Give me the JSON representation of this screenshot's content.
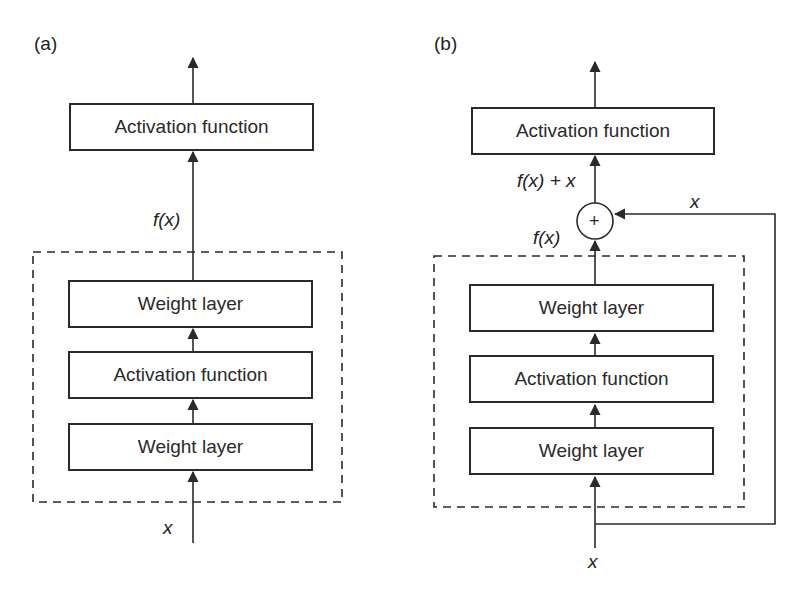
{
  "panels": {
    "a": {
      "label": "(a)",
      "top_box": "Activation function",
      "output_label": "f(x)",
      "block": [
        "Weight layer",
        "Activation function",
        "Weight layer"
      ],
      "input_label": "x"
    },
    "b": {
      "label": "(b)",
      "top_box": "Activation function",
      "sum_label": "f(x) + x",
      "block_output_label": "f(x)",
      "skip_label": "x",
      "adder_symbol": "+",
      "block": [
        "Weight layer",
        "Activation function",
        "Weight layer"
      ],
      "input_label": "x"
    }
  },
  "colors": {
    "line": "#2a2a2a",
    "background": "#ffffff"
  }
}
